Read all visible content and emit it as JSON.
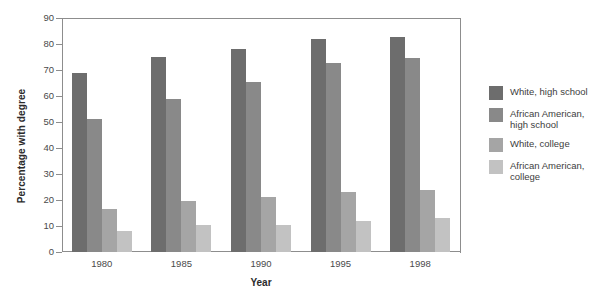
{
  "chart_data": {
    "type": "bar",
    "title": "",
    "xlabel": "Year",
    "ylabel": "Percentage with degree",
    "categories": [
      "1980",
      "1985",
      "1990",
      "1995",
      "1998"
    ],
    "ylim": [
      0,
      90
    ],
    "yticks": [
      0,
      10,
      20,
      30,
      40,
      50,
      60,
      70,
      80,
      90
    ],
    "grid": false,
    "legend_position": "right",
    "series": [
      {
        "name": "White, high school",
        "color": "#6d6d6d",
        "values": [
          69,
          75,
          78,
          82,
          82.5
        ]
      },
      {
        "name": "African American,\nhigh school",
        "color": "#898989",
        "values": [
          51,
          59,
          65.5,
          72.5,
          74.5
        ]
      },
      {
        "name": "White, college",
        "color": "#a5a5a5",
        "values": [
          16.5,
          19.5,
          21,
          23,
          24
        ]
      },
      {
        "name": "African American,\ncollege",
        "color": "#c2c2c2",
        "values": [
          8,
          10.5,
          10.5,
          12,
          13
        ]
      }
    ]
  },
  "axis": {
    "y_title": "Percentage with degree",
    "x_title": "Year",
    "y_tick_labels": [
      "90",
      "80",
      "70",
      "60",
      "50",
      "40",
      "30",
      "20",
      "10",
      "0"
    ],
    "x_tick_labels": [
      "1980",
      "1985",
      "1990",
      "1995",
      "1998"
    ]
  },
  "legend": {
    "items": [
      {
        "label": "White, high school",
        "color": "#6d6d6d"
      },
      {
        "label": "African American,\nhigh school",
        "color": "#898989"
      },
      {
        "label": "White, college",
        "color": "#a5a5a5"
      },
      {
        "label": "African American,\ncollege",
        "color": "#c2c2c2"
      }
    ]
  },
  "colors": {
    "axis": "#8d8d8d",
    "text": "#3d3d3d",
    "background": "#ffffff"
  }
}
